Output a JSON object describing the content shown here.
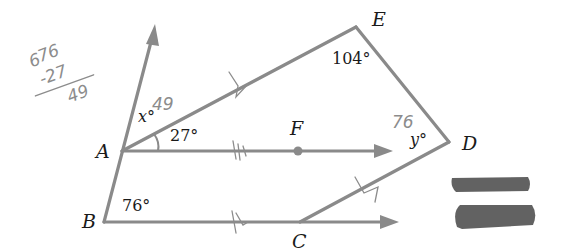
{
  "diagram": {
    "type": "geometry",
    "points": {
      "A": {
        "label": "A",
        "x": 122,
        "y": 151
      },
      "B": {
        "label": "B",
        "x": 104,
        "y": 222
      },
      "C": {
        "label": "C",
        "x": 300,
        "y": 222
      },
      "D": {
        "label": "D",
        "x": 449,
        "y": 142
      },
      "E": {
        "label": "E",
        "x": 356,
        "y": 27
      },
      "F": {
        "label": "F",
        "x": 298,
        "y": 151
      }
    },
    "angles": {
      "E": "104°",
      "A_FAE": "27°",
      "B": "76°",
      "x": "x°",
      "y": "y°"
    },
    "handwritten": {
      "x_answer": "49",
      "y_answer": "76",
      "calc_top": "76",
      "calc_top_prefix": "6",
      "calc_sub": "-27",
      "calc_result": "49"
    },
    "redactions": 2,
    "colors": {
      "line": "#8a8a8a",
      "text": "#1a1a1a",
      "pencil": "#8c8c8c",
      "redaction": "#5a5a5a"
    }
  }
}
